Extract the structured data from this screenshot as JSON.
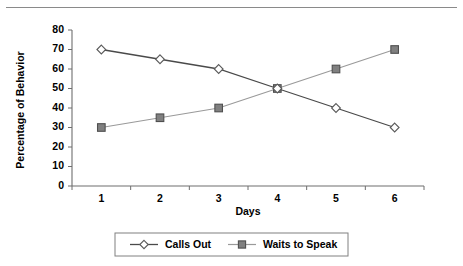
{
  "chart_data": {
    "type": "line",
    "title": "",
    "xlabel": "Days",
    "ylabel": "Percentage of Behavior",
    "categories": [
      "1",
      "2",
      "3",
      "4",
      "5",
      "6"
    ],
    "ylim": [
      0,
      80
    ],
    "yticks": [
      "0",
      "10",
      "20",
      "30",
      "40",
      "50",
      "60",
      "70",
      "80"
    ],
    "grid": false,
    "legend_position": "bottom",
    "series": [
      {
        "name": "Calls Out",
        "marker": "diamond-open",
        "color": "#4a4a4a",
        "values": [
          70,
          65,
          60,
          50,
          40,
          30
        ]
      },
      {
        "name": "Waits to Speak",
        "marker": "square-filled",
        "color": "#808080",
        "values": [
          30,
          35,
          40,
          50,
          60,
          70
        ]
      }
    ]
  },
  "legend": {
    "entries": [
      {
        "label": "Calls Out"
      },
      {
        "label": "Waits to Speak"
      }
    ]
  },
  "decorations": {
    "top_rule": "horizontal-rule"
  }
}
